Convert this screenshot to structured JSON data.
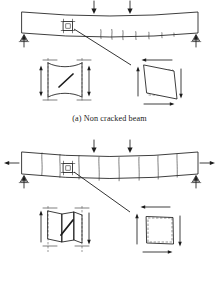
{
  "document": {
    "kind": "engineering-figure",
    "title_a": "(a) Non cracked beam",
    "title_b": "(a) Pre-cracked beam"
  },
  "figure_a": {
    "caption": "(a) Non cracked beam",
    "beam": {
      "label": "simply-supported-beam",
      "span_left": 22,
      "span_right": 198,
      "top_y": 9,
      "thickness": 22,
      "sag": 6
    },
    "loads": [
      {
        "name": "point-load-1",
        "x": 94,
        "direction": "down"
      },
      {
        "name": "point-load-2",
        "x": 130,
        "direction": "down"
      }
    ],
    "supports": [
      {
        "name": "pin-support-left",
        "x": 24,
        "reaction": "up"
      },
      {
        "name": "roller-support-right",
        "x": 196,
        "reaction": "up"
      }
    ],
    "crack_zone": {
      "name": "flexural-crack-zone",
      "count": 6,
      "x_start": 98,
      "x_end": 176
    },
    "element_marker": {
      "name": "stress-element-marker",
      "x": 68,
      "y": 26
    },
    "leader": {
      "name": "leader-line",
      "from_x": 76,
      "from_y": 30,
      "to_x": 130,
      "to_y": 64
    },
    "detail_left": {
      "name": "shear-element-deformed-hourglass",
      "note": "vertical element with diagonal crack, dashed reference edges"
    },
    "detail_right": {
      "name": "shear-element-parallelogram",
      "note": "sheared square, dashed original, shear arrows top/bottom/sides"
    }
  },
  "figure_b": {
    "caption": "(a) Pre-cracked beam",
    "beam": {
      "label": "pre-cracked-simply-supported-beam",
      "span_left": 22,
      "span_right": 198,
      "top_y": 152,
      "thickness": 22,
      "sag": 7
    },
    "loads": [
      {
        "name": "point-load-1",
        "x": 94,
        "direction": "down"
      },
      {
        "name": "point-load-2",
        "x": 130,
        "direction": "down"
      }
    ],
    "axial": [
      {
        "name": "axial-arrow-left",
        "x": 12,
        "direction": "left"
      },
      {
        "name": "axial-arrow-right",
        "x": 207,
        "direction": "right"
      }
    ],
    "supports": [
      {
        "name": "pin-support-left",
        "x": 24,
        "reaction": "up"
      },
      {
        "name": "roller-support-right",
        "x": 196,
        "reaction": "up"
      }
    ],
    "pre_cracks": {
      "name": "through-crack-set",
      "count": 8
    },
    "element_marker": {
      "name": "stress-element-marker",
      "x": 68,
      "y": 170
    },
    "leader": {
      "name": "leader-line",
      "from_x": 76,
      "from_y": 176,
      "to_x": 128,
      "to_y": 214
    },
    "detail_left": {
      "name": "block-rotation-element",
      "note": "rigid block between two cracks rotating, diagonal slip, vertical arrows"
    },
    "detail_right": {
      "name": "undeformed-square-element",
      "note": "square remains unsheared, shear arrows around"
    }
  },
  "colors": {
    "ink": "#1c1c1c",
    "crack": "#333333",
    "dashed": "#555555",
    "paper": "#ffffff"
  }
}
